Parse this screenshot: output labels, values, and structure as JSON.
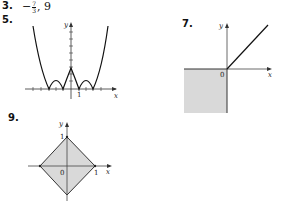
{
  "answers": [
    {
      "number": "3.",
      "sign": "−",
      "frac_num": "7",
      "frac_den": "3",
      "rest": ", 9"
    },
    {
      "number": "5.",
      "graph": {
        "x_label": "x",
        "y_label": "y",
        "tick_label": "1"
      }
    },
    {
      "number": "7.",
      "graph": {
        "x_label": "x",
        "y_label": "y",
        "origin_label": "0"
      }
    },
    {
      "number": "9.",
      "graph": {
        "x_label": "x",
        "y_label": "y",
        "origin_label": "0",
        "x_tick": "1",
        "y_tick": "1"
      }
    }
  ],
  "colors": {
    "shade": "#d9d9d9",
    "line": "#222222"
  }
}
